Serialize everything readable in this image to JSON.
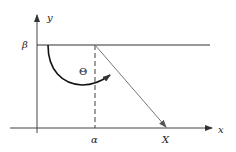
{
  "diagram": {
    "axes": {
      "x_label": "x",
      "y_label": "y"
    },
    "labels": {
      "beta": "β",
      "alpha": "α",
      "theta": "Θ",
      "X": "X"
    },
    "elements": [
      {
        "type": "axis",
        "name": "x-axis",
        "label": "x"
      },
      {
        "type": "axis",
        "name": "y-axis",
        "label": "y"
      },
      {
        "type": "horizontal-line",
        "name": "beta-line",
        "at": "β"
      },
      {
        "type": "dashed-vertical-line",
        "name": "alpha-line",
        "at": "α"
      },
      {
        "type": "arrow",
        "name": "ray-to-X",
        "from": "(α, β)",
        "to": "X"
      },
      {
        "type": "arc-arrow",
        "name": "angle-theta",
        "label": "Θ"
      }
    ],
    "colors": {
      "stroke": "#222222",
      "ray": "#777777",
      "axis": "#444444"
    }
  }
}
